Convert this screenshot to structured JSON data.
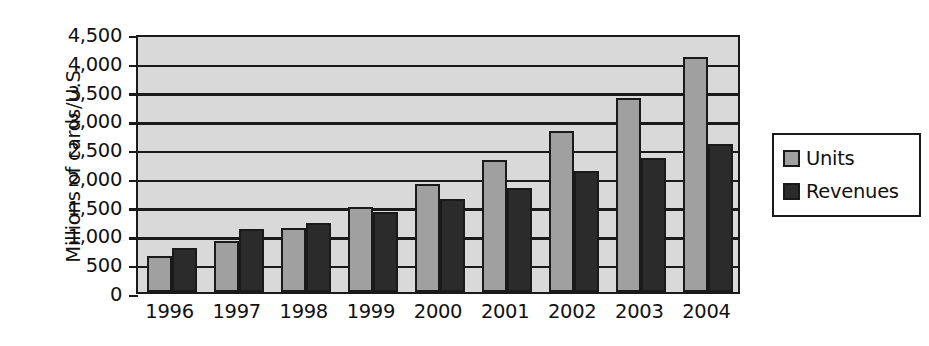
{
  "chart_data": {
    "type": "bar",
    "title": "",
    "xlabel": "",
    "ylabel": "Millions of cards/U.S.",
    "categories": [
      "1996",
      "1997",
      "1998",
      "1999",
      "2000",
      "2001",
      "2002",
      "2003",
      "2004"
    ],
    "series": [
      {
        "name": "Units",
        "color": "#a0a0a0",
        "values": [
          620,
          880,
          1120,
          1470,
          1880,
          2290,
          2800,
          3370,
          4080
        ]
      },
      {
        "name": "Revenues",
        "color": "#2b2b2b",
        "values": [
          760,
          1100,
          1200,
          1390,
          1620,
          1810,
          2110,
          2330,
          2580
        ]
      }
    ],
    "ylim": [
      0,
      4500
    ],
    "ytick_values": [
      0,
      500,
      1000,
      1500,
      2000,
      2500,
      3000,
      3500,
      4000,
      4500
    ],
    "ytick_labels": [
      "0",
      "500",
      "1,000",
      "1,500",
      "2,000",
      "2,500",
      "3,000",
      "3,500",
      "4,000",
      "4,500"
    ],
    "grid": true,
    "legend_position": "right",
    "plot_background": "#d9d9d9",
    "axis_color": "#1a1a1a"
  },
  "legend": {
    "entries": [
      {
        "label": "Units"
      },
      {
        "label": "Revenues"
      }
    ]
  }
}
